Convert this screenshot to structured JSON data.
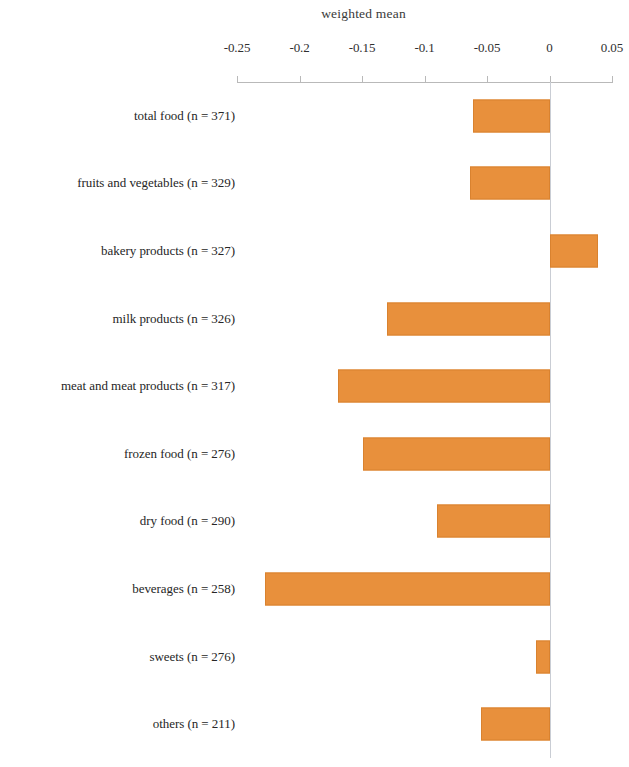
{
  "chart_data": {
    "type": "bar",
    "orientation": "horizontal",
    "title": "weighted mean",
    "xlabel": "",
    "ylabel": "",
    "xlim": [
      -0.25,
      0.05
    ],
    "xticks": [
      -0.25,
      -0.2,
      -0.15,
      -0.1,
      -0.05,
      0,
      0.05
    ],
    "xtick_labels": [
      "-0.25",
      "-0.2",
      "-0.15",
      "-0.1",
      "-0.05",
      "0",
      "0.05"
    ],
    "grid": false,
    "legend": null,
    "zero_reference_line": 0,
    "bar_color": "#e8903c",
    "bar_edge_color": "#d9822f",
    "axis_color": "#b9b9b9",
    "categories": [
      "total food (n = 371)",
      "fruits and vegetables (n = 329)",
      "bakery products (n = 327)",
      "milk products (n = 326)",
      "meat and meat products (n = 317)",
      "frozen food (n = 276)",
      "dry food  (n = 290)",
      "beverages (n = 258)",
      "sweets (n = 276)",
      "others (n = 211)"
    ],
    "values": [
      -0.061,
      -0.064,
      0.039,
      -0.13,
      -0.169,
      -0.149,
      -0.09,
      -0.228,
      -0.011,
      -0.055
    ],
    "points": [
      {
        "category": "total food (n = 371)",
        "n": 371,
        "value": -0.061
      },
      {
        "category": "fruits and vegetables (n = 329)",
        "n": 329,
        "value": -0.064
      },
      {
        "category": "bakery products (n = 327)",
        "n": 327,
        "value": 0.039
      },
      {
        "category": "milk products (n = 326)",
        "n": 326,
        "value": -0.13
      },
      {
        "category": "meat and meat products (n = 317)",
        "n": 317,
        "value": -0.169
      },
      {
        "category": "frozen food (n = 276)",
        "n": 276,
        "value": -0.149
      },
      {
        "category": "dry food  (n = 290)",
        "n": 290,
        "value": -0.09
      },
      {
        "category": "beverages (n = 258)",
        "n": 258,
        "value": -0.228
      },
      {
        "category": "sweets (n = 276)",
        "n": 276,
        "value": -0.011
      },
      {
        "category": "others (n = 211)",
        "n": 211,
        "value": -0.055
      }
    ]
  }
}
